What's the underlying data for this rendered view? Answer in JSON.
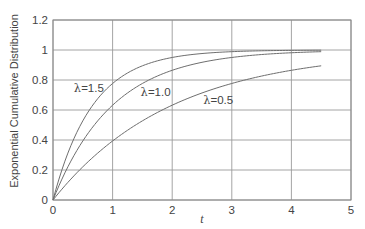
{
  "chart_data": {
    "type": "line",
    "title": "",
    "xlabel": "t",
    "ylabel": "Exponential Cumulative Distribution",
    "xlim": [
      0,
      5
    ],
    "ylim": [
      0,
      1.2
    ],
    "xticks": [
      "0",
      "1",
      "2",
      "3",
      "4",
      "5"
    ],
    "yticks": [
      "0",
      "0.2",
      "0.4",
      "0.6",
      "0.8",
      "1",
      "1.2"
    ],
    "grid": true,
    "legend": "none (inline annotations)",
    "x": [
      0,
      0.25,
      0.5,
      0.75,
      1,
      1.25,
      1.5,
      1.75,
      2,
      2.5,
      3,
      3.5,
      4,
      4.5
    ],
    "series": [
      {
        "name": "λ = 1.5",
        "lambda": 1.5,
        "values": [
          0,
          0.313,
          0.528,
          0.675,
          0.777,
          0.847,
          0.895,
          0.928,
          0.95,
          0.977,
          0.989,
          0.995,
          0.998,
          0.999
        ]
      },
      {
        "name": "λ = 1.0",
        "lambda": 1.0,
        "values": [
          0,
          0.221,
          0.393,
          0.528,
          0.632,
          0.713,
          0.777,
          0.826,
          0.865,
          0.918,
          0.95,
          0.97,
          0.982,
          0.989
        ]
      },
      {
        "name": "λ = 0.5",
        "lambda": 0.5,
        "values": [
          0,
          0.118,
          0.221,
          0.313,
          0.393,
          0.465,
          0.528,
          0.583,
          0.632,
          0.713,
          0.777,
          0.826,
          0.865,
          0.895
        ]
      }
    ],
    "annotations": [
      {
        "text": "λ = 1.5",
        "lambda_symbol": "λ",
        "value_text": "= 1.5",
        "x": 0.35,
        "y": 0.75
      },
      {
        "text": "λ = 1.0",
        "lambda_symbol": "λ",
        "value_text": "= 1.0",
        "x": 1.47,
        "y": 0.72
      },
      {
        "text": "λ = 0.5",
        "lambda_symbol": "λ",
        "value_text": "= 0.5",
        "x": 2.52,
        "y": 0.67
      }
    ]
  }
}
